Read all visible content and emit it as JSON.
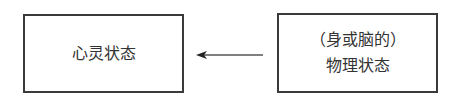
{
  "diagram": {
    "left_box": {
      "label": "心灵状态"
    },
    "right_box": {
      "line1": "（身或脑的）",
      "line2": "物理状态"
    },
    "arrow": {
      "direction": "right-to-left",
      "from": "right_box",
      "to": "left_box"
    }
  }
}
